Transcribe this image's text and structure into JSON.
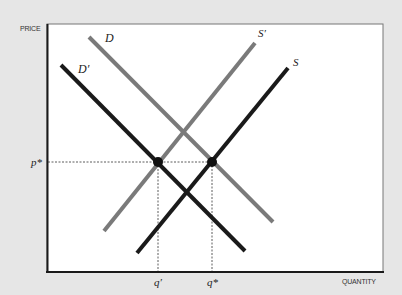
{
  "chart_data": {
    "type": "diagram",
    "title": "",
    "xlabel": "QUANTITY",
    "ylabel": "PRICE",
    "colors": {
      "background": "#e6e6e6",
      "plot_area": "#ffffff",
      "original_curves": "#7a7a7a",
      "shifted_curves": "#1a1a1a",
      "axes": "#1a1a1a"
    },
    "series": [
      {
        "name": "D",
        "label": "D",
        "kind": "demand",
        "style": "gray",
        "points": [
          [
            89,
            37
          ],
          [
            273,
            222
          ]
        ]
      },
      {
        "name": "D'",
        "label": "D′",
        "kind": "demand",
        "style": "black",
        "points": [
          [
            61,
            65
          ],
          [
            245,
            251
          ]
        ]
      },
      {
        "name": "S'",
        "label": "S′",
        "kind": "supply",
        "style": "gray",
        "points": [
          [
            104,
            231
          ],
          [
            255,
            43
          ]
        ]
      },
      {
        "name": "S",
        "label": "S",
        "kind": "supply",
        "style": "black",
        "points": [
          [
            137,
            253
          ],
          [
            288,
            68
          ]
        ]
      }
    ],
    "equilibria": [
      {
        "name": "E'",
        "x": 158,
        "y": 162,
        "q_label": "q′",
        "p_label": "p*"
      },
      {
        "name": "E*",
        "x": 212,
        "y": 162,
        "q_label": "q*",
        "p_label": "p*"
      }
    ],
    "tick_labels": {
      "y": [
        "p*"
      ],
      "x": [
        "q′",
        "q*"
      ]
    },
    "grid": false,
    "legend": "inline labels at curve ends"
  },
  "labels": {
    "price_axis": "PRICE",
    "quantity_axis": "QUANTITY",
    "D": "D",
    "D_prime": "D′",
    "S": "S",
    "S_prime": "S′",
    "p_star": "p*",
    "q_prime": "q′",
    "q_star": "q*"
  }
}
